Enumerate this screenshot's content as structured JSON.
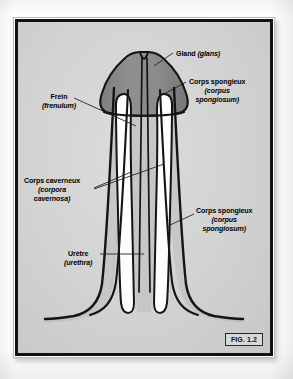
{
  "figure": {
    "tag": "FIG. 1.2",
    "background_color": "#d3d3d3",
    "frame_color": "#111111",
    "glans_color": "#8a8a8a",
    "cavernosa_color": "#fdfdfd",
    "spongiosum_color": "#c2c2c2",
    "outline_color": "#111111"
  },
  "labels": {
    "gland": {
      "fr": "Gland",
      "la": "(glans)"
    },
    "spongieux_top": {
      "fr": "Corps spongieux",
      "la1": "(corpus",
      "la2": "spongiosum)"
    },
    "frein": {
      "fr": "Frein",
      "la": "(frenulum)"
    },
    "caverneux": {
      "fr": "Corps caverneux",
      "la1": "(corpora",
      "la2": "cavernosa)"
    },
    "spongieux_bottom": {
      "fr": "Corps spongieux",
      "la1": "(corpus",
      "la2": "spongiosum)"
    },
    "uretre": {
      "fr": "Urètre",
      "la": "(urethra)"
    }
  },
  "anatomy": {
    "type": "cross-section-diagram",
    "subject": "penis longitudinal cross-section",
    "structures": [
      {
        "name": "gland",
        "label_fr": "Gland",
        "label_la": "glans",
        "fill": "#8a8a8a"
      },
      {
        "name": "corpus-spongiosum",
        "label_fr": "Corps spongieux",
        "label_la": "corpus spongiosum",
        "fill": "#c2c2c2"
      },
      {
        "name": "corpora-cavernosa",
        "label_fr": "Corps caverneux",
        "label_la": "corpora cavernosa",
        "fill": "#fdfdfd",
        "count": 2
      },
      {
        "name": "urethra",
        "label_fr": "Urètre",
        "label_la": "urethra",
        "fill": "#c2c2c2"
      },
      {
        "name": "frenulum",
        "label_fr": "Frein",
        "label_la": "frenulum"
      }
    ]
  }
}
